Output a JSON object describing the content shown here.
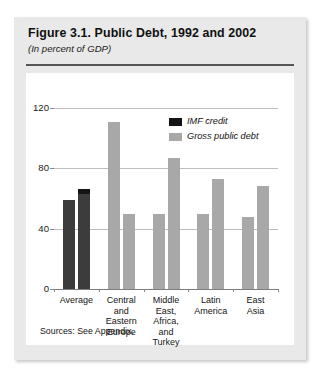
{
  "figure": {
    "title": "Figure 3.1. Public Debt, 1992 and 2002",
    "subtitle": "(In percent of GDP)",
    "source_note": "Sources: See Appendix."
  },
  "legend": {
    "position": "top-right",
    "items": [
      {
        "label": "IMF credit",
        "color": "#141414"
      },
      {
        "label": "Gross public debt",
        "color": "#a8a8a8"
      }
    ]
  },
  "colors": {
    "bar_average": "#3c3c3c",
    "bar_imf_credit": "#141414",
    "bar_gross_debt": "#a8a8a8",
    "gridline": "#bdbdbd",
    "axis": "#7d7d7d",
    "card_background": "#e9e9e9",
    "plot_background": "#ffffff"
  },
  "chart_data": {
    "type": "bar",
    "title": "Figure 3.1. Public Debt, 1992 and 2002",
    "subtitle": "(In percent of GDP)",
    "xlabel": "",
    "ylabel": "",
    "ylim": [
      0,
      120
    ],
    "yticks": [
      0,
      40,
      80,
      120
    ],
    "ytick_labels": [
      "0",
      "40",
      "80",
      "120"
    ],
    "grid": true,
    "categories": [
      "Average",
      "Central and Eastern Europe",
      "Middle East, Africa, and Turkey",
      "Latin America",
      "East Asia"
    ],
    "category_lines": [
      [
        "Average"
      ],
      [
        "Central",
        "and",
        "Eastern",
        "Europe"
      ],
      [
        "Middle",
        "East,",
        "Africa,",
        "and",
        "Turkey"
      ],
      [
        "Latin",
        "America"
      ],
      [
        "East",
        "Asia"
      ]
    ],
    "series": [
      {
        "name": "1992",
        "values": [
          59,
          111,
          50,
          50,
          48
        ]
      },
      {
        "name": "2002",
        "values": [
          66,
          50,
          87,
          73,
          68
        ]
      }
    ],
    "imf_credit_caps": [
      {
        "category": "Average",
        "series": "2002",
        "value": 3
      }
    ],
    "annotations": [
      "Sources: See Appendix."
    ]
  }
}
